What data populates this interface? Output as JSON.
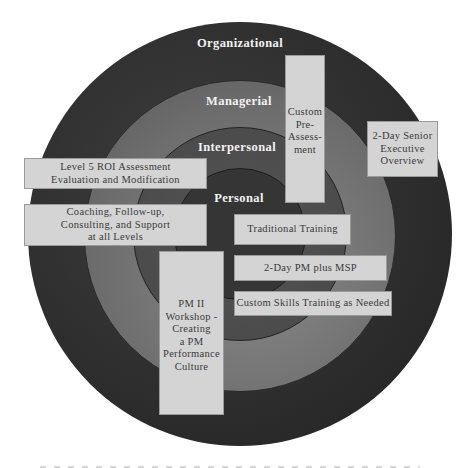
{
  "diagram": {
    "type": "concentric-circles",
    "rings": [
      {
        "id": "organizational",
        "label": "Organizational",
        "color": "#2e2e2e"
      },
      {
        "id": "managerial",
        "label": "Managerial",
        "color": "#787878"
      },
      {
        "id": "interpersonal",
        "label": "Interpersonal",
        "color": "#4c4c4c"
      },
      {
        "id": "personal",
        "label": "Personal",
        "color": "#353535"
      }
    ],
    "boxes": [
      {
        "id": "custom-pre-assessment",
        "label": "Custom\nPre-\nAssess-\nment"
      },
      {
        "id": "senior-executive-overview",
        "label": "2-Day Senior\nExecutive\nOverview"
      },
      {
        "id": "level5-roi",
        "label": "Level 5 ROI Assessment\nEvaluation and Modification"
      },
      {
        "id": "coaching",
        "label": "Coaching, Follow-up,\nConsulting, and Support\nat all Levels"
      },
      {
        "id": "traditional-training",
        "label": "Traditional Training"
      },
      {
        "id": "pm-plus-msp",
        "label": "2-Day PM plus MSP"
      },
      {
        "id": "custom-skills",
        "label": "Custom Skills Training as Needed"
      },
      {
        "id": "pm-ii-workshop",
        "label": "PM II\nWorkshop -\nCreating\na PM\nPerformance\nCulture"
      }
    ],
    "box_color": "#d4d4d4",
    "background": "#ffffff"
  }
}
